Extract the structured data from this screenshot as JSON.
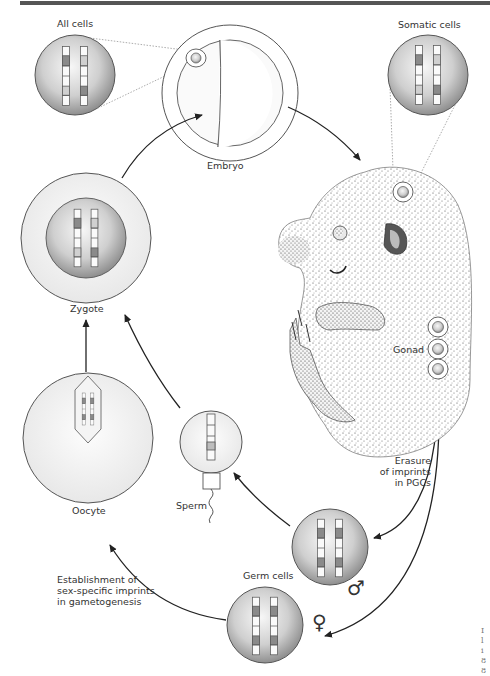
{
  "figure": {
    "stages": {
      "all_cells": "All cells",
      "embryo": "Embryo",
      "somatic_cells": "Somatic cells",
      "zygote": "Zygote",
      "gonad": "Gonad",
      "oocyte": "Oocyte",
      "sperm": "Sperm",
      "germ_cells": "Germ cells"
    },
    "annotations": {
      "erasure": "Erasure\nof imprints\nin PGCs",
      "establishment": "Establishment of\nsex-specific imprints\nin gametogenesis"
    },
    "symbols": {
      "male": "♂",
      "female": "♀"
    },
    "edge_text": "I\nl\ni\n8\n8",
    "colors": {
      "cell_fill_center": "#f2f2f2",
      "cell_fill_edge": "#9a9a9a",
      "outline": "#444444",
      "band_dark": "#7a7a7a",
      "band_light": "#d8d8d8",
      "embryo_stipple": "#555555"
    }
  }
}
